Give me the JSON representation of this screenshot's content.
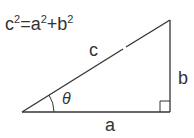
{
  "formula": {
    "base1": "c",
    "exp1": "2",
    "eq": "=",
    "base2": "a",
    "exp2": "2",
    "plus": "+",
    "base3": "b",
    "exp3": "2"
  },
  "labels": {
    "hypotenuse": "c",
    "opposite": "b",
    "adjacent": "a",
    "angle": "θ"
  },
  "colors": {
    "stroke": "#333333",
    "background": "#ffffff"
  }
}
